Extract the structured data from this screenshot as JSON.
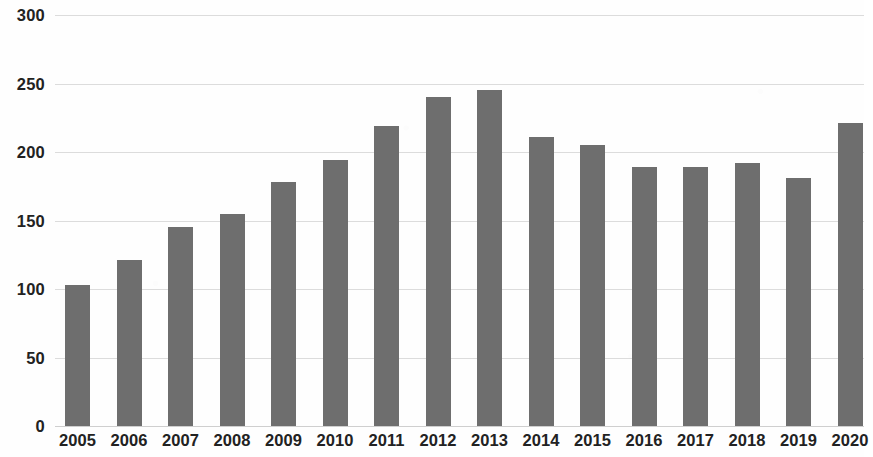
{
  "chart_data": {
    "type": "bar",
    "title": "",
    "subtitle": "",
    "xlabel": "",
    "ylabel": "",
    "categories": [
      "2005",
      "2006",
      "2007",
      "2008",
      "2009",
      "2010",
      "2011",
      "2012",
      "2013",
      "2014",
      "2015",
      "2016",
      "2017",
      "2018",
      "2019",
      "2020"
    ],
    "values": [
      103,
      121,
      145,
      155,
      178,
      194,
      219,
      240,
      245,
      211,
      205,
      189,
      189,
      192,
      181,
      221
    ],
    "series": [
      {
        "name": "",
        "values": [
          103,
          121,
          145,
          155,
          178,
          194,
          219,
          240,
          245,
          211,
          205,
          189,
          189,
          192,
          181,
          221
        ]
      }
    ],
    "ylim": [
      0,
      300
    ],
    "y_ticks": [
      0,
      50,
      100,
      150,
      200,
      250,
      300
    ],
    "y_tick_labels": [
      "0",
      "50",
      "100",
      "150",
      "200",
      "250",
      "300"
    ],
    "x_tick_labels": [
      "2005",
      "2006",
      "2007",
      "2008",
      "2009",
      "2010",
      "2011",
      "2012",
      "2013",
      "2014",
      "2015",
      "2016",
      "2017",
      "2018",
      "2019",
      "2020"
    ],
    "grid": true,
    "grid_axis": "y",
    "legend": false,
    "legend_position": "none",
    "annotations": [],
    "colors": {
      "bar": "#6e6e6e",
      "gridline": "#dcdcdc",
      "axis_text": "#222222",
      "background": "#fefefe"
    }
  }
}
